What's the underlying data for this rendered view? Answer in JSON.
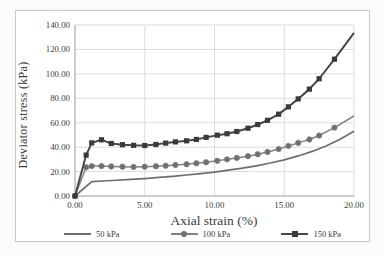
{
  "colors": {
    "frame_border": "#c9c9c9",
    "plot_background": "#ffffff",
    "gridline": "#dcdcdc",
    "axis_line": "#9c9c9c",
    "text": "#3c3c3c"
  },
  "chart_data": {
    "type": "line",
    "title": "",
    "xlabel": "Axial strain (%)",
    "ylabel": "Deviator stress (kPa)",
    "xlim": [
      0,
      20
    ],
    "ylim": [
      0,
      140
    ],
    "grid": true,
    "legend_position": "bottom",
    "x_ticks": [
      0,
      5,
      10,
      15,
      20
    ],
    "x_tick_labels": [
      "0.00",
      "5.00",
      "10.00",
      "15.00",
      "20.00"
    ],
    "y_ticks": [
      0,
      20,
      40,
      60,
      80,
      100,
      120,
      140
    ],
    "y_tick_labels": [
      "0.00",
      "20.00",
      "40.00",
      "60.00",
      "80.00",
      "100.00",
      "120.00",
      "140.00"
    ],
    "series": [
      {
        "name": "50 kPa",
        "marker": "none",
        "color": "#6e6e6e",
        "line_width": 1.7,
        "x": [
          0,
          1.2,
          2,
          3,
          4,
          5,
          6,
          7,
          8,
          9,
          10,
          11,
          12,
          13,
          14,
          15,
          16,
          17,
          18,
          19,
          20
        ],
        "y": [
          0,
          11.8,
          12.3,
          12.9,
          13.6,
          14.3,
          15.2,
          16.1,
          17.2,
          18.3,
          19.6,
          21.2,
          22.8,
          24.7,
          27,
          29.6,
          32.8,
          36.5,
          41,
          46.5,
          53
        ]
      },
      {
        "name": "100 kPa",
        "marker": "circle",
        "color": "#828282",
        "marker_color": "#6f6f6f",
        "line_width": 1.5,
        "x": [
          0,
          0.8,
          1.2,
          1.9,
          2.6,
          3.4,
          4.2,
          5.0,
          5.8,
          6.5,
          7.2,
          8.0,
          8.7,
          9.4,
          10.2,
          10.9,
          11.6,
          12.4,
          13.1,
          13.8,
          14.6,
          15.3,
          16.0,
          16.8,
          17.5,
          18.6,
          20.0
        ],
        "y": [
          0,
          23.5,
          24.5,
          24.5,
          24.2,
          24.0,
          23.8,
          24.0,
          24.3,
          24.8,
          25.4,
          26.0,
          26.8,
          27.6,
          28.8,
          30.0,
          31.2,
          32.6,
          34.2,
          36.0,
          38.4,
          41.0,
          43.5,
          46.3,
          49.5,
          56.0,
          65.5
        ]
      },
      {
        "name": "150 kPa",
        "marker": "square",
        "color": "#474747",
        "marker_color": "#3a3a3a",
        "line_width": 2,
        "x": [
          0,
          0.8,
          1.2,
          1.9,
          2.6,
          3.4,
          4.2,
          5.0,
          5.8,
          6.5,
          7.2,
          8.0,
          8.7,
          9.4,
          10.2,
          10.9,
          11.6,
          12.4,
          13.1,
          13.8,
          14.6,
          15.3,
          16.0,
          16.8,
          17.5,
          18.6,
          20.0
        ],
        "y": [
          0,
          33.5,
          43.5,
          46.0,
          43.0,
          42.0,
          41.5,
          41.3,
          42.2,
          43.3,
          44.3,
          45.2,
          46.3,
          48.0,
          49.8,
          51.0,
          52.8,
          55.5,
          58.5,
          62.0,
          67.0,
          73.0,
          79.5,
          87.5,
          96.0,
          112.0,
          133.5
        ]
      }
    ]
  }
}
